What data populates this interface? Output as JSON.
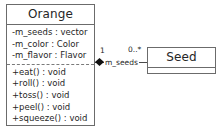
{
  "diagram": {
    "type": "uml-class-diagram",
    "background_color": "#ffffff",
    "line_color": "#6b6b6b"
  },
  "classes": [
    {
      "id": "orange",
      "name": "Orange",
      "attributes": [
        "-m_seeds : vector",
        "-m_color : Color",
        "-m_flavor : Flavor"
      ],
      "operations": [
        "+eat() : void",
        "+roll() : void",
        "+toss() : void",
        "+peel() : void",
        "+squeeze() : void"
      ]
    },
    {
      "id": "seed",
      "name": "Seed",
      "attributes": [],
      "operations": []
    }
  ],
  "association": {
    "kind": "composition",
    "source": "orange",
    "target": "seed",
    "source_multiplicity": "1",
    "target_multiplicity": "0..*",
    "role_label": "m_seeds"
  }
}
